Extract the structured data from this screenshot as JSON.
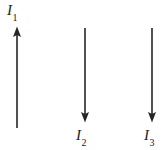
{
  "figure": {
    "type": "physics-diagram",
    "background_color": "#ffffff",
    "stroke_color": "#262626",
    "width": 168,
    "height": 150
  },
  "wires": [
    {
      "id": "wire-1",
      "label_symbol": "I",
      "label_subscript": "1",
      "direction": "up",
      "x": 17,
      "line_top": 27,
      "line_bottom": 128,
      "arrow_tip_y": 27,
      "label_position": "above"
    },
    {
      "id": "wire-2",
      "label_symbol": "I",
      "label_subscript": "2",
      "direction": "down",
      "x": 85,
      "line_top": 28,
      "line_bottom": 122,
      "arrow_tip_y": 122,
      "label_position": "below"
    },
    {
      "id": "wire-3",
      "label_symbol": "I",
      "label_subscript": "3",
      "direction": "down",
      "x": 152,
      "line_top": 28,
      "line_bottom": 122,
      "arrow_tip_y": 122,
      "label_position": "below"
    }
  ]
}
